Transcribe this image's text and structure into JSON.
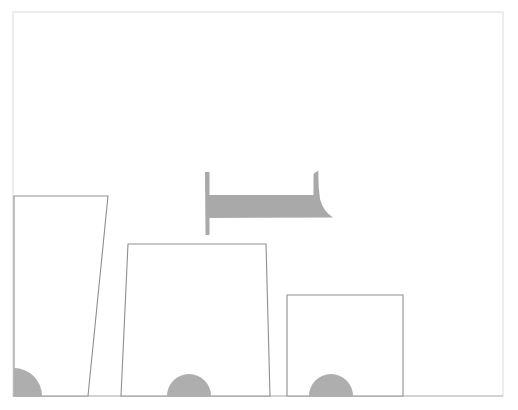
{
  "canvas": {
    "width": 518,
    "height": 410,
    "background_color": "#ffffff",
    "title": "",
    "caption": ""
  },
  "palette": {
    "background": "#ffffff",
    "frame_stroke": "#e2e2e2",
    "outline_stroke": "#8f8f8f",
    "baseline_stroke": "#b9b9b9",
    "fill_white": "#ffffff",
    "solid_gray": "#a9a9a9",
    "wheel_gray": "#aeaeae"
  },
  "frame": {
    "name": "border-frame",
    "x": 13,
    "y": 12,
    "width": 490,
    "height": 384,
    "stroke_width": 1.2
  },
  "baseline": {
    "name": "ground-line",
    "x1": 13,
    "y1": 396,
    "x2": 503,
    "y2": 396,
    "stroke_width": 1.2
  },
  "shapes": [
    {
      "name": "left-block",
      "kind": "quadrilateral",
      "label": "tall left block",
      "points": "14,196 108,196 88,396 14,396",
      "stroke_width": 1.1
    },
    {
      "name": "middle-block",
      "kind": "quadrilateral",
      "label": "middle trapezoid block",
      "points": "128,244 266,244 270,396 121,396",
      "stroke_width": 1.1
    },
    {
      "name": "right-block",
      "kind": "quadrilateral",
      "label": "short right block",
      "points": "287,295 403,295 403,396 287,396",
      "stroke_width": 1.1
    }
  ],
  "wheels": [
    {
      "name": "wheel-left",
      "kind": "quarter-circle",
      "cx": 14,
      "cy": 396,
      "r": 28,
      "path": "M 14,368 A 28,28 0 0 1 42,396 L 14,396 Z"
    },
    {
      "name": "wheel-middle",
      "kind": "half-circle",
      "cx": 189,
      "cy": 396,
      "r": 22,
      "path": "M 167,396 A 22,22 0 0 1 211,396 Z"
    },
    {
      "name": "wheel-right",
      "kind": "half-circle",
      "cx": 331,
      "cy": 396,
      "r": 22,
      "path": "M 309,396 A 22,22 0 0 1 353,396 Z"
    }
  ],
  "beam": {
    "name": "gray-beam",
    "kind": "i-beam-flag",
    "label": "gray beam with tapered tail",
    "color": "#a9a9a9",
    "stem_x": 205,
    "stem_top_y": 172,
    "stem_bottom_y": 235,
    "bar_top_y": 195,
    "bar_bottom_y": 218,
    "bar_right_x": 333,
    "tail_x": 318,
    "tail_top_y": 171,
    "path": "M 205,172 L 209.5,172 L 209.5,195 L 313.5,195 L 313.5,174 Q 316.5,171 318.5,171 Q 318,186 320,199 Q 323,211 333,217.5 L 209.5,218 L 209.5,235 L 205.5,235 Z"
  },
  "annotations": {
    "has_text": false,
    "visible_labels": []
  },
  "chart_data": {
    "type": "bar",
    "title": "",
    "subtitle": "",
    "xlabel": "",
    "ylabel": "",
    "categories": [
      "left-block",
      "middle-block",
      "right-block"
    ],
    "values": [
      200,
      152,
      101
    ],
    "value_unit": "px height above baseline",
    "ylim": [
      0,
      384
    ],
    "grid": false,
    "legend": "none"
  }
}
